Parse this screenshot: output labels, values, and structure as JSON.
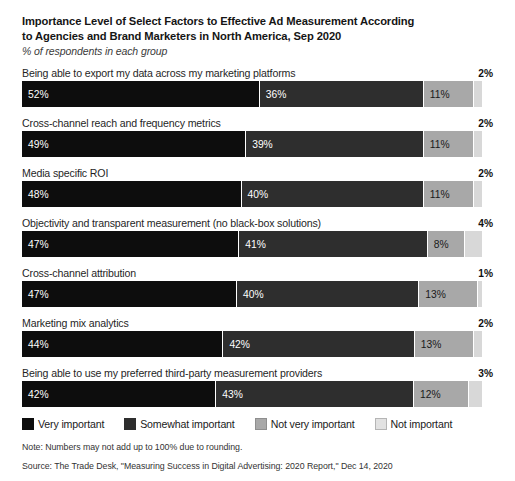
{
  "header": {
    "title_line1": "Importance Level of Select Factors to Effective Ad Measurement According",
    "title_line2": "to Agencies and Brand Marketers in North America, Sep 2020",
    "subtitle": "% of respondents in each group"
  },
  "footer": {
    "note": "Note: Numbers may not add up to 100% due to rounding.",
    "source": "Source: The Trade Desk, \"Measuring Success in Digital Advertising: 2020 Report,\" Dec 14, 2020"
  },
  "legend": {
    "items": [
      {
        "label": "Very important",
        "color": "#0d0d0d"
      },
      {
        "label": "Somewhat important",
        "color": "#2e2e2e"
      },
      {
        "label": "Not very important",
        "color": "#a8a8a8"
      },
      {
        "label": "Not important",
        "color": "#d8d8d8"
      }
    ]
  },
  "chart_data": {
    "type": "bar",
    "title": "Importance Level of Select Factors to Effective Ad Measurement According to Agencies and Brand Marketers in North America, Sep 2020",
    "subtitle": "% of respondents in each group",
    "xlabel": "",
    "ylabel": "",
    "stacked": true,
    "orientation": "horizontal",
    "unit": "%",
    "legend_position": "bottom",
    "grid": false,
    "categories": [
      "Being able to export my data across my marketing platforms",
      "Cross-channel reach and frequency metrics",
      "Media specific ROI",
      "Objectivity and transparent measurement (no black-box solutions)",
      "Cross-channel attribution",
      "Marketing mix analytics",
      "Being able to use my preferred third-party measurement providers"
    ],
    "series": [
      {
        "name": "Very important",
        "values": [
          52,
          49,
          48,
          47,
          47,
          44,
          42
        ]
      },
      {
        "name": "Somewhat important",
        "values": [
          36,
          39,
          40,
          41,
          40,
          42,
          43
        ]
      },
      {
        "name": "Not very important",
        "values": [
          11,
          11,
          11,
          8,
          13,
          13,
          12
        ]
      },
      {
        "name": "Not important",
        "values": [
          2,
          2,
          2,
          4,
          1,
          2,
          3
        ]
      }
    ]
  },
  "rows": [
    {
      "label": "Being able to export my data across my marketing platforms",
      "outer_value": "2%",
      "segments": [
        {
          "value": 52,
          "text": "52%"
        },
        {
          "value": 36,
          "text": "36%"
        },
        {
          "value": 11,
          "text": "11%"
        },
        {
          "value": 2,
          "text": ""
        }
      ]
    },
    {
      "label": "Cross-channel reach and frequency metrics",
      "outer_value": "2%",
      "segments": [
        {
          "value": 49,
          "text": "49%"
        },
        {
          "value": 39,
          "text": "39%"
        },
        {
          "value": 11,
          "text": "11%"
        },
        {
          "value": 2,
          "text": ""
        }
      ]
    },
    {
      "label": "Media specific ROI",
      "outer_value": "2%",
      "segments": [
        {
          "value": 48,
          "text": "48%"
        },
        {
          "value": 40,
          "text": "40%"
        },
        {
          "value": 11,
          "text": "11%"
        },
        {
          "value": 2,
          "text": ""
        }
      ]
    },
    {
      "label": "Objectivity and transparent measurement (no black-box solutions)",
      "outer_value": "4%",
      "segments": [
        {
          "value": 47,
          "text": "47%"
        },
        {
          "value": 41,
          "text": "41%"
        },
        {
          "value": 8,
          "text": "8%"
        },
        {
          "value": 4,
          "text": ""
        }
      ]
    },
    {
      "label": "Cross-channel attribution",
      "outer_value": "1%",
      "segments": [
        {
          "value": 47,
          "text": "47%"
        },
        {
          "value": 40,
          "text": "40%"
        },
        {
          "value": 13,
          "text": "13%"
        },
        {
          "value": 1,
          "text": ""
        }
      ]
    },
    {
      "label": "Marketing mix analytics",
      "outer_value": "2%",
      "segments": [
        {
          "value": 44,
          "text": "44%"
        },
        {
          "value": 42,
          "text": "42%"
        },
        {
          "value": 13,
          "text": "13%"
        },
        {
          "value": 2,
          "text": ""
        }
      ]
    },
    {
      "label": "Being able to use my preferred third-party measurement providers",
      "outer_value": "3%",
      "segments": [
        {
          "value": 42,
          "text": "42%"
        },
        {
          "value": 43,
          "text": "43%"
        },
        {
          "value": 12,
          "text": "12%"
        },
        {
          "value": 3,
          "text": ""
        }
      ]
    }
  ]
}
